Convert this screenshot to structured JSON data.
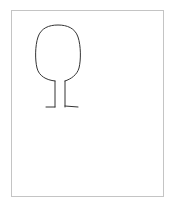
{
  "title": "",
  "drawing": {
    "subject": "tree",
    "stroke_color": "#333333",
    "frame_color": "#c4c4c4",
    "parts": [
      "canopy",
      "trunk",
      "left-root",
      "right-root"
    ]
  }
}
